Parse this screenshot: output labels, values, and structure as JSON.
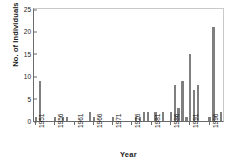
{
  "chart_data": {
    "type": "bar",
    "title": "",
    "xlabel": "Year",
    "ylabel": "No. of Individuals",
    "ylim": [
      0,
      25
    ],
    "yticks": [
      0,
      5,
      10,
      15,
      20,
      25
    ],
    "xtick_labels": [
      "1951",
      "1956",
      "1961",
      "1966",
      "1971",
      "1976",
      "1981",
      "1986",
      "1991",
      "1996"
    ],
    "xtick_years": [
      1951,
      1956,
      1961,
      1966,
      1971,
      1976,
      1981,
      1986,
      1991,
      1996
    ],
    "grid": false,
    "legend": "none",
    "bar_color": "#7f7f7f",
    "axis_color": "#6b6b6b",
    "categories": [
      1951,
      1952,
      1953,
      1954,
      1955,
      1956,
      1957,
      1958,
      1959,
      1960,
      1961,
      1962,
      1963,
      1964,
      1965,
      1966,
      1967,
      1968,
      1969,
      1970,
      1971,
      1972,
      1973,
      1974,
      1975,
      1976,
      1977,
      1978,
      1979,
      1980,
      1981,
      1982,
      1983,
      1984,
      1985,
      1986,
      1987,
      1988,
      1989,
      1990,
      1991,
      1992,
      1993,
      1994,
      1995,
      1996,
      1997,
      1998,
      1999
    ],
    "values": [
      1,
      9,
      0,
      0,
      0,
      1,
      0,
      1,
      1,
      0,
      0,
      0,
      0,
      0,
      2,
      1,
      0,
      0,
      0,
      0,
      1,
      0,
      0,
      0,
      0,
      0,
      1,
      1,
      2,
      2,
      0,
      2,
      0,
      2,
      0,
      2,
      8,
      3,
      9,
      1,
      15,
      7,
      8,
      0,
      0,
      1,
      21,
      0,
      2
    ]
  }
}
